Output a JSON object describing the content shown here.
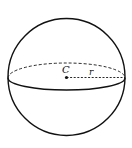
{
  "diagram": {
    "center_label": "C",
    "radius_label": "r",
    "colors": {
      "stroke": "#111111",
      "background": "#ffffff"
    }
  }
}
